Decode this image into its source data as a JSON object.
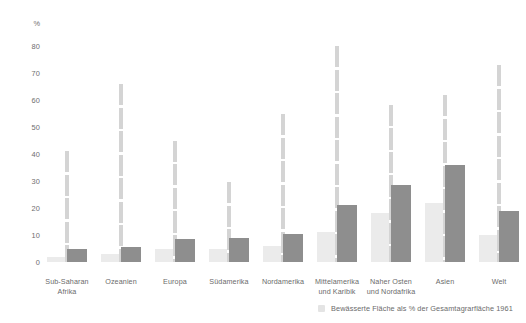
{
  "chart_data": {
    "type": "bar",
    "title": "",
    "subtitle": "",
    "xlabel": "",
    "ylabel": "%",
    "ylim": [
      0,
      85
    ],
    "yticks": [
      0,
      10,
      20,
      30,
      40,
      50,
      60,
      70,
      80
    ],
    "ytick_labels": [
      "0",
      "10",
      "20",
      "30",
      "40",
      "50",
      "60",
      "70",
      "80"
    ],
    "grid": false,
    "legend_position": "bottom-right",
    "categories": [
      "Sub-Saharan Afrika",
      "Ozeanien",
      "Europa",
      "Südamerika",
      "Nordamerika",
      "Mittelamerika und Karibik",
      "Naher Osten und Nordafrika",
      "Asien",
      "Welt"
    ],
    "category_lines": [
      [
        "Sub-Saharan",
        "Afrika"
      ],
      [
        "Ozeanien"
      ],
      [
        "Europa"
      ],
      [
        "Südamerika"
      ],
      [
        "Nordamerika"
      ],
      [
        "Mittelamerika",
        "und Karibik"
      ],
      [
        "Naher Osten",
        "und Nordafrika"
      ],
      [
        "Asien"
      ],
      [
        "Welt"
      ]
    ],
    "series": [
      {
        "name": "Bewässerte Fläche als % der Gesamtagrarfläche 1961",
        "color": "#ebebeb",
        "values": [
          2,
          3,
          5,
          5,
          6,
          11,
          18,
          22,
          10
        ]
      },
      {
        "name": "dark-bar-series",
        "color": "#8e8e8e",
        "values": [
          5,
          5.5,
          8.5,
          9,
          10.5,
          21,
          28.5,
          36,
          19
        ]
      },
      {
        "name": "riser-series",
        "color": "#d4d4d4",
        "values": [
          41,
          66,
          45,
          29.5,
          55,
          80,
          58,
          62,
          73
        ]
      }
    ]
  },
  "axis": {
    "unit_label": "%",
    "ticks": [
      "80",
      "70",
      "60",
      "50",
      "40",
      "30",
      "20",
      "10",
      "0"
    ]
  },
  "legend": {
    "items": [
      {
        "label": "Bewässerte Fläche als % der Gesamtagrarfläche 1961",
        "swatch_color": "#e4e4e4",
        "icon": "square-swatch-icon"
      }
    ]
  }
}
